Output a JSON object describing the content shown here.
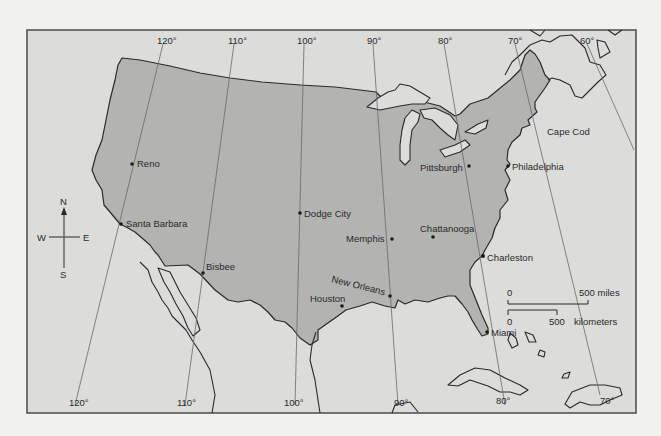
{
  "map": {
    "title": "",
    "colors": {
      "page_background": "#f1f1f0",
      "ocean_and_foreign_land": "#dcdcdb",
      "united_states": "#b3b3b2",
      "outline": "#2a2a2a",
      "meridian": "#6a6a6a"
    },
    "meridians_top": [
      {
        "label": "120°",
        "lon": 120
      },
      {
        "label": "110°",
        "lon": 110
      },
      {
        "label": "100°",
        "lon": 100
      },
      {
        "label": "90°",
        "lon": 90
      },
      {
        "label": "80°",
        "lon": 80
      },
      {
        "label": "70°",
        "lon": 70
      },
      {
        "label": "60°",
        "lon": 60
      }
    ],
    "meridians_bottom": [
      {
        "label": "120°",
        "lon": 120
      },
      {
        "label": "110°",
        "lon": 110
      },
      {
        "label": "100°",
        "lon": 100
      },
      {
        "label": "90°",
        "lon": 90
      },
      {
        "label": "80°",
        "lon": 80
      },
      {
        "label": "70°",
        "lon": 70
      }
    ],
    "cities": [
      {
        "name": "Reno"
      },
      {
        "name": "Santa Barbara"
      },
      {
        "name": "Bisbee"
      },
      {
        "name": "Dodge City"
      },
      {
        "name": "Houston"
      },
      {
        "name": "New Orleans"
      },
      {
        "name": "Memphis"
      },
      {
        "name": "Chattanooga"
      },
      {
        "name": "Pittsburgh"
      },
      {
        "name": "Philadelphia"
      },
      {
        "name": "Cape Cod"
      },
      {
        "name": "Charleston"
      },
      {
        "name": "Miami"
      }
    ],
    "compass": {
      "north": "N",
      "south": "S",
      "east": "E",
      "west": "W"
    },
    "scale_bar": {
      "miles_start": "0",
      "miles_end": "500 miles",
      "km_start": "0",
      "km_end": "500",
      "km_unit": "kilometers"
    }
  }
}
